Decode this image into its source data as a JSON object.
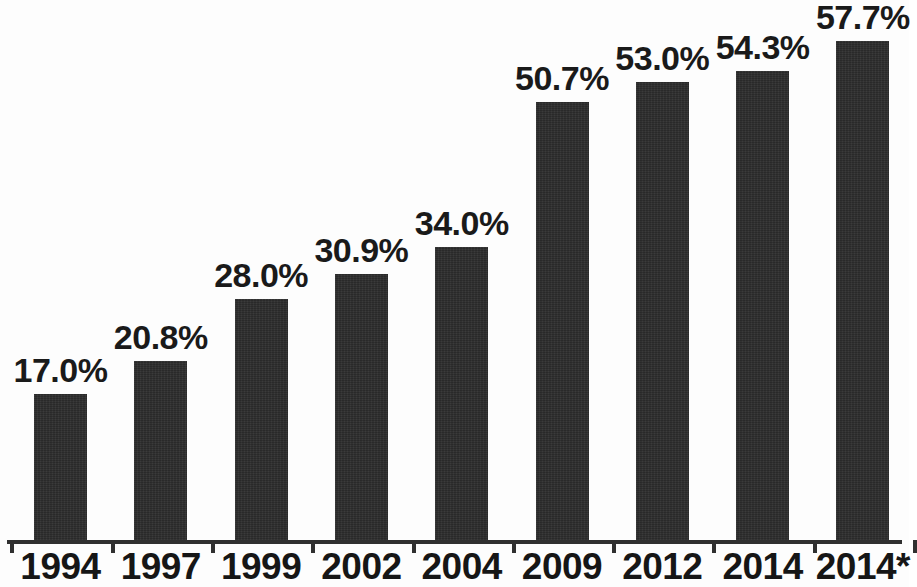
{
  "chart_data": {
    "type": "bar",
    "title": "",
    "subtitle": "",
    "xlabel": "",
    "ylabel": "",
    "categories": [
      "1994",
      "1997",
      "1999",
      "2002",
      "2004",
      "2009",
      "2012",
      "2014",
      "2014*"
    ],
    "values": [
      17.0,
      20.8,
      28.0,
      30.9,
      34.0,
      50.7,
      53.0,
      54.3,
      57.7
    ],
    "data_labels": [
      "17.0%",
      "20.8%",
      "28.0%",
      "30.9%",
      "34.0%",
      "50.7%",
      "53.0%",
      "54.3%",
      "57.7%"
    ],
    "ylim": [
      0,
      60.5
    ],
    "grid": false,
    "legend": null,
    "bar_color": "#2d2d2d",
    "axis_color": "#303030",
    "background_color": "#fdfdfd",
    "annotations": [
      "* asterisk on final category label"
    ]
  },
  "axis": {
    "tick_count": 10
  }
}
